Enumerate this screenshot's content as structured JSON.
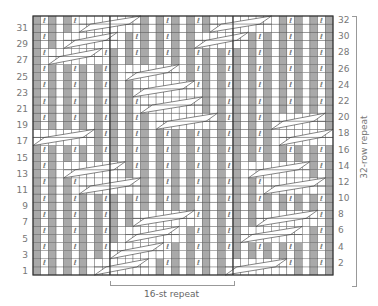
{
  "chart": {
    "rows": 32,
    "cols": 39,
    "grid": {
      "x": 33,
      "y": 16,
      "width": 300,
      "height": 259
    },
    "repeat_lines_x": [
      110,
      233
    ],
    "colors": {
      "purl": "#a9a9a9",
      "knit": "#ffffff",
      "grid": "#555555",
      "border": "#333333",
      "symbol": "#555555"
    },
    "purl_columns": [
      0,
      2,
      4,
      6,
      8,
      10,
      12,
      14,
      16,
      18,
      20,
      22,
      24,
      26,
      28,
      30,
      32,
      34,
      36,
      38
    ],
    "twist_symbol": "ℓ",
    "twist_rows": "even",
    "cable_zones": [
      {
        "row_from": 31,
        "row_to": 32,
        "col_from": 6,
        "col_to": 13
      },
      {
        "row_from": 29,
        "row_to": 30,
        "col_from": 4,
        "col_to": 10
      },
      {
        "row_from": 27,
        "row_to": 28,
        "col_from": 2,
        "col_to": 8
      },
      {
        "row_from": 17,
        "row_to": 18,
        "col_from": 0,
        "col_to": 7
      },
      {
        "row_from": 25,
        "row_to": 26,
        "col_from": 12,
        "col_to": 18
      },
      {
        "row_from": 23,
        "row_to": 24,
        "col_from": 13,
        "col_to": 20
      },
      {
        "row_from": 21,
        "row_to": 22,
        "col_from": 14,
        "col_to": 21
      },
      {
        "row_from": 19,
        "row_to": 20,
        "col_from": 16,
        "col_to": 23
      },
      {
        "row_from": 13,
        "row_to": 14,
        "col_from": 4,
        "col_to": 11
      },
      {
        "row_from": 11,
        "row_to": 12,
        "col_from": 6,
        "col_to": 13
      },
      {
        "row_from": 7,
        "row_to": 8,
        "col_from": 13,
        "col_to": 20
      },
      {
        "row_from": 5,
        "row_to": 6,
        "col_from": 12,
        "col_to": 18
      },
      {
        "row_from": 3,
        "row_to": 4,
        "col_from": 10,
        "col_to": 16
      },
      {
        "row_from": 1,
        "row_to": 2,
        "col_from": 8,
        "col_to": 14
      },
      {
        "row_from": 31,
        "row_to": 32,
        "col_from": 23,
        "col_to": 30
      },
      {
        "row_from": 29,
        "row_to": 30,
        "col_from": 21,
        "col_to": 27
      },
      {
        "row_from": 17,
        "row_to": 18,
        "col_from": 32,
        "col_to": 38
      },
      {
        "row_from": 19,
        "row_to": 20,
        "col_from": 31,
        "col_to": 37
      },
      {
        "row_from": 13,
        "row_to": 14,
        "col_from": 28,
        "col_to": 35
      },
      {
        "row_from": 11,
        "row_to": 12,
        "col_from": 30,
        "col_to": 37
      },
      {
        "row_from": 7,
        "row_to": 8,
        "col_from": 29,
        "col_to": 36
      },
      {
        "row_from": 5,
        "row_to": 6,
        "col_from": 27,
        "col_to": 34
      },
      {
        "row_from": 1,
        "row_to": 2,
        "col_from": 25,
        "col_to": 32
      }
    ]
  },
  "labels": {
    "left_rows": [
      "31",
      "29",
      "27",
      "25",
      "23",
      "21",
      "19",
      "17",
      "15",
      "13",
      "11",
      "9",
      "7",
      "5",
      "3",
      "1"
    ],
    "right_rows": [
      "32",
      "30",
      "28",
      "26",
      "24",
      "22",
      "20",
      "18",
      "16",
      "14",
      "12",
      "10",
      "8",
      "6",
      "4",
      "2"
    ],
    "row_repeat": "32-row repeat",
    "stitch_repeat": "16-st repeat"
  }
}
